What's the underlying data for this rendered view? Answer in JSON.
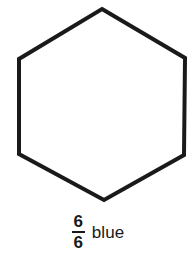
{
  "figure": {
    "background_color": "#ffffff",
    "shape": {
      "name": "hexagon",
      "sides": 6,
      "orientation": "pointy-top",
      "fill_color": "#ffffff",
      "stroke_color": "#1a1a1a",
      "stroke_width": 4,
      "vertices": [
        [
          102,
          9
        ],
        [
          185,
          58
        ],
        [
          184,
          155
        ],
        [
          104,
          200
        ],
        [
          19,
          154
        ],
        [
          19,
          59
        ]
      ]
    },
    "caption": {
      "fraction": {
        "numerator": "6",
        "denominator": "6"
      },
      "word": "blue"
    }
  }
}
